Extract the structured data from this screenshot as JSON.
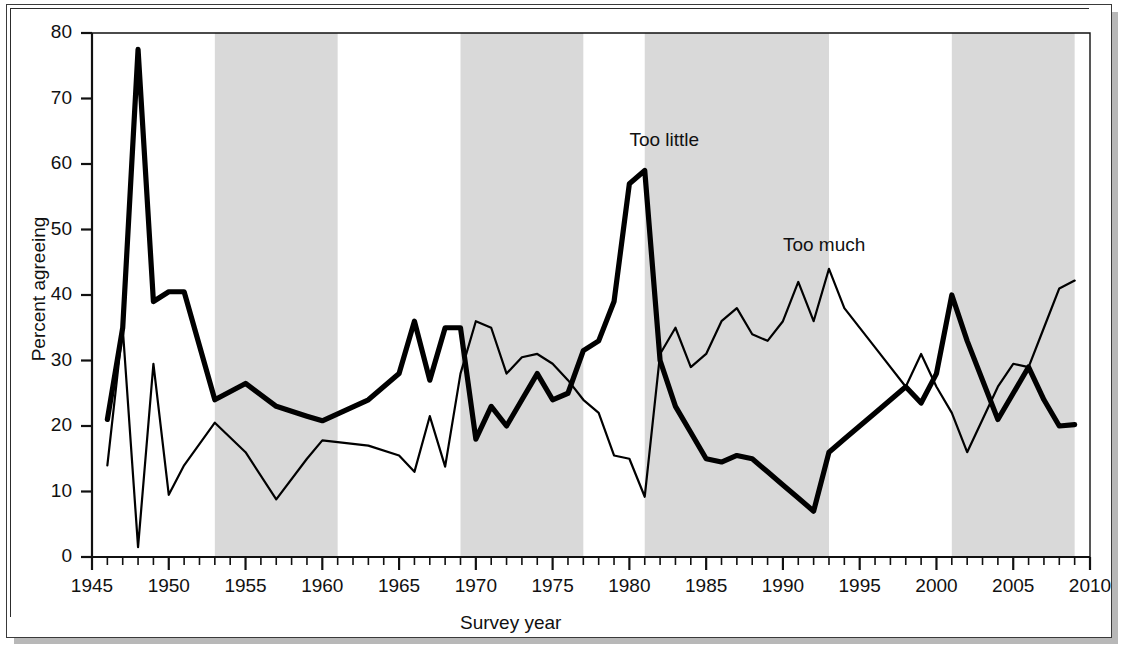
{
  "chart_data": {
    "type": "line",
    "title": "",
    "xlabel": "Survey year",
    "ylabel": "Percent agreeing",
    "xlim": [
      1945,
      2010
    ],
    "ylim": [
      0,
      80
    ],
    "xticks": [
      1945,
      1950,
      1955,
      1960,
      1965,
      1970,
      1975,
      1980,
      1985,
      1990,
      1995,
      2000,
      2005,
      2010
    ],
    "xtick_labels": [
      "1945",
      "1950",
      "1955",
      "1960",
      "1965",
      "1970",
      "1975",
      "1980",
      "1985",
      "1990",
      "1995",
      "2000",
      "2005",
      "2010"
    ],
    "yticks": [
      0,
      10,
      20,
      30,
      40,
      50,
      60,
      70,
      80
    ],
    "ytick_labels": [
      "0",
      "10",
      "20",
      "30",
      "40",
      "50",
      "60",
      "70",
      "80"
    ],
    "minor_xtick_step": 1,
    "grid": false,
    "legend_position": "inline-annotation",
    "shaded_bands_label": "Republican presidential administrations",
    "shaded_band_color": "#d9d9d9",
    "series": [
      {
        "name": "Too little",
        "line_width": "thick",
        "color": "#000000",
        "points": [
          [
            1946,
            21
          ],
          [
            1947,
            35
          ],
          [
            1948,
            77.5
          ],
          [
            1949,
            39
          ],
          [
            1950,
            40.5
          ],
          [
            1951,
            40.5
          ],
          [
            1953,
            24
          ],
          [
            1955,
            26.5
          ],
          [
            1957,
            23
          ],
          [
            1959,
            21.5
          ],
          [
            1960,
            20.8
          ],
          [
            1963,
            24
          ],
          [
            1965,
            28
          ],
          [
            1966,
            36
          ],
          [
            1967,
            27
          ],
          [
            1968,
            35
          ],
          [
            1969,
            35
          ],
          [
            1970,
            18
          ],
          [
            1971,
            23
          ],
          [
            1972,
            20
          ],
          [
            1973,
            24
          ],
          [
            1974,
            28
          ],
          [
            1975,
            24
          ],
          [
            1976,
            25
          ],
          [
            1977,
            31.5
          ],
          [
            1978,
            33
          ],
          [
            1979,
            39
          ],
          [
            1980,
            57
          ],
          [
            1981,
            59
          ],
          [
            1982,
            30
          ],
          [
            1983,
            23
          ],
          [
            1984,
            19
          ],
          [
            1985,
            15
          ],
          [
            1986,
            14.5
          ],
          [
            1987,
            15.5
          ],
          [
            1988,
            15
          ],
          [
            1989,
            13
          ],
          [
            1990,
            11
          ],
          [
            1991,
            9
          ],
          [
            1992,
            7
          ],
          [
            1993,
            16
          ],
          [
            1994,
            18
          ],
          [
            1996,
            22
          ],
          [
            1998,
            26
          ],
          [
            1999,
            23.5
          ],
          [
            2000,
            28
          ],
          [
            2001,
            40
          ],
          [
            2002,
            33
          ],
          [
            2004,
            21
          ],
          [
            2005,
            25
          ],
          [
            2006,
            29
          ],
          [
            2007,
            24
          ],
          [
            2008,
            20
          ],
          [
            2009,
            20.2
          ]
        ]
      },
      {
        "name": "Too much",
        "line_width": "thin",
        "color": "#000000",
        "points": [
          [
            1946,
            14
          ],
          [
            1947,
            35
          ],
          [
            1948,
            1.5
          ],
          [
            1949,
            29.5
          ],
          [
            1950,
            9.5
          ],
          [
            1951,
            14
          ],
          [
            1953,
            20.5
          ],
          [
            1955,
            16
          ],
          [
            1957,
            8.8
          ],
          [
            1959,
            15
          ],
          [
            1960,
            17.8
          ],
          [
            1963,
            17
          ],
          [
            1965,
            15.5
          ],
          [
            1966,
            13
          ],
          [
            1967,
            21.5
          ],
          [
            1968,
            13.8
          ],
          [
            1969,
            28
          ],
          [
            1970,
            36
          ],
          [
            1971,
            35
          ],
          [
            1972,
            28
          ],
          [
            1973,
            30.5
          ],
          [
            1974,
            31
          ],
          [
            1975,
            29.5
          ],
          [
            1976,
            27
          ],
          [
            1977,
            24
          ],
          [
            1978,
            22
          ],
          [
            1979,
            15.5
          ],
          [
            1980,
            15
          ],
          [
            1981,
            9.2
          ],
          [
            1982,
            31
          ],
          [
            1983,
            35
          ],
          [
            1984,
            29
          ],
          [
            1985,
            31
          ],
          [
            1986,
            36
          ],
          [
            1987,
            38
          ],
          [
            1988,
            34
          ],
          [
            1989,
            33
          ],
          [
            1990,
            36
          ],
          [
            1991,
            42
          ],
          [
            1992,
            36
          ],
          [
            1993,
            44
          ],
          [
            1994,
            38
          ],
          [
            1996,
            32
          ],
          [
            1998,
            26
          ],
          [
            1999,
            31
          ],
          [
            2000,
            26
          ],
          [
            2001,
            22
          ],
          [
            2002,
            16
          ],
          [
            2004,
            26
          ],
          [
            2005,
            29.5
          ],
          [
            2006,
            29
          ],
          [
            2007,
            35
          ],
          [
            2008,
            41
          ],
          [
            2009,
            42.2
          ]
        ]
      }
    ],
    "annotations": [
      {
        "text": "Too little",
        "x": 1980.0,
        "y": 63.5,
        "anchor": "start"
      },
      {
        "text": "Too much",
        "x": 1990.0,
        "y": 47.5,
        "anchor": "start"
      }
    ],
    "shaded_bands": [
      {
        "start": 1953,
        "end": 1961
      },
      {
        "start": 1969,
        "end": 1977
      },
      {
        "start": 1981,
        "end": 1993
      },
      {
        "start": 2001,
        "end": 2009
      }
    ]
  }
}
